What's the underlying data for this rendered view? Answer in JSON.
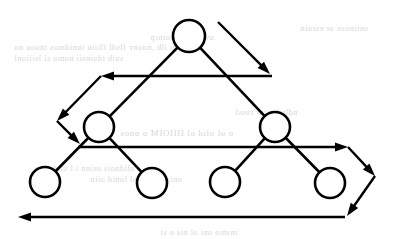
{
  "figure": {
    "canvas": {
      "width": 402,
      "height": 239,
      "background": "#ffffff"
    },
    "ink_color": "#000000",
    "bleed_color": "#c9c9c9"
  },
  "nodes": [
    {
      "id": "root",
      "label": "",
      "cx": 189,
      "cy": 36,
      "r": 16,
      "level": 0,
      "name": "tree-node-root"
    },
    {
      "id": "left",
      "label": "",
      "cx": 99,
      "cy": 127,
      "r": 15,
      "level": 1,
      "name": "tree-node-left-internal"
    },
    {
      "id": "right",
      "label": "",
      "cx": 275,
      "cy": 127,
      "r": 15,
      "level": 1,
      "name": "tree-node-right-internal"
    },
    {
      "id": "leaf1",
      "label": "",
      "cx": 45,
      "cy": 182,
      "r": 15,
      "level": 2,
      "name": "tree-node-leaf-1"
    },
    {
      "id": "leaf2",
      "label": "",
      "cx": 152,
      "cy": 183,
      "r": 15,
      "level": 2,
      "name": "tree-node-leaf-2"
    },
    {
      "id": "leaf3",
      "label": "",
      "cx": 225,
      "cy": 182,
      "r": 15,
      "level": 2,
      "name": "tree-node-leaf-3"
    },
    {
      "id": "leaf4",
      "label": "",
      "cx": 330,
      "cy": 183,
      "r": 15,
      "level": 2,
      "name": "tree-node-leaf-4"
    }
  ],
  "edges": [
    {
      "from": "root",
      "to": "left",
      "name": "tree-edge-root-left"
    },
    {
      "from": "root",
      "to": "right",
      "name": "tree-edge-root-right"
    },
    {
      "from": "left",
      "to": "leaf1",
      "name": "tree-edge-left-leaf1"
    },
    {
      "from": "left",
      "to": "leaf2",
      "name": "tree-edge-left-leaf2"
    },
    {
      "from": "right",
      "to": "leaf3",
      "name": "tree-edge-right-leaf3"
    },
    {
      "from": "right",
      "to": "leaf4",
      "name": "tree-edge-right-leaf4"
    }
  ],
  "traversal_arrows": [
    {
      "id": "a1",
      "name": "traversal-arrow-root-to-level1",
      "description": "diagonal arrow descending from root to level-1 row, rightward-down",
      "x1": 218,
      "y1": 22,
      "x2": 270,
      "y2": 74
    },
    {
      "id": "a2",
      "name": "traversal-arrow-level1-right-to-left",
      "description": "horizontal arrow sweeping right to left across level-1 row",
      "x1": 272,
      "y1": 76,
      "x2": 101,
      "y2": 76
    },
    {
      "id": "a3",
      "name": "traversal-arrow-wrap-down-left",
      "description": "diagonal wrap arrow descending left after level-1 sweep",
      "x1": 101,
      "y1": 76,
      "x2": 57,
      "y2": 121
    },
    {
      "id": "a4",
      "name": "traversal-arrow-wrap-down-right",
      "description": "diagonal wrap arrow descending right into level-2 row start",
      "x1": 57,
      "y1": 121,
      "x2": 80,
      "y2": 144
    },
    {
      "id": "a5",
      "name": "traversal-arrow-level2-left-to-right",
      "description": "horizontal arrow sweeping left to right across level-2 row",
      "x1": 78,
      "y1": 147,
      "x2": 348,
      "y2": 147
    },
    {
      "id": "a6",
      "name": "traversal-arrow-wrap-down-right-2",
      "description": "diagonal wrap arrow descending right past level-2 row",
      "x1": 348,
      "y1": 147,
      "x2": 375,
      "y2": 176
    },
    {
      "id": "a7",
      "name": "traversal-arrow-wrap-down-left-2",
      "description": "diagonal wrap arrow descending left to bottom return row",
      "x1": 375,
      "y1": 176,
      "x2": 347,
      "y2": 216
    },
    {
      "id": "a8",
      "name": "traversal-arrow-bottom-right-to-left",
      "description": "bottom horizontal arrow sweeping right to left",
      "x1": 345,
      "y1": 217,
      "x2": 18,
      "y2": 217
    }
  ],
  "style": {
    "node_stroke_width": 2.6,
    "edge_stroke_width": 2.6,
    "path_stroke_width": 2.4,
    "arrow_head_length": 13,
    "arrow_head_width": 9
  },
  "bleed_through_text": [
    {
      "text": "sntinoos or esroin",
      "x": 300,
      "y": 24,
      "size": 8
    },
    {
      "text": "uv s  snioi  notnrp",
      "x": 150,
      "y": 33,
      "size": 8
    },
    {
      "text": "sinsiunui  ilb ,noonv flsdl fliiiu iunidmos tnoou no",
      "x": 14,
      "y": 43,
      "size": 8
    },
    {
      "text": "suib tdoinsii numo si  lsiiionl",
      "x": 14,
      "y": 54,
      "size": 8
    },
    {
      "text": "ndlsrb  oinr  rossl",
      "x": 235,
      "y": 108,
      "size": 8
    },
    {
      "text": "o ol  olid   ol  IIIIOIM  o  onos",
      "x": 120,
      "y": 128,
      "size": 9
    },
    {
      "text": "i olidnois  osinn   i l   olidonoo",
      "x": 34,
      "y": 164,
      "size": 8
    },
    {
      "text": "onioi s olid  sl  lonid  oiin",
      "x": 90,
      "y": 175,
      "size": 8
    },
    {
      "text": "insmo oni  ol nis  o si",
      "x": 160,
      "y": 228,
      "size": 8
    }
  ]
}
